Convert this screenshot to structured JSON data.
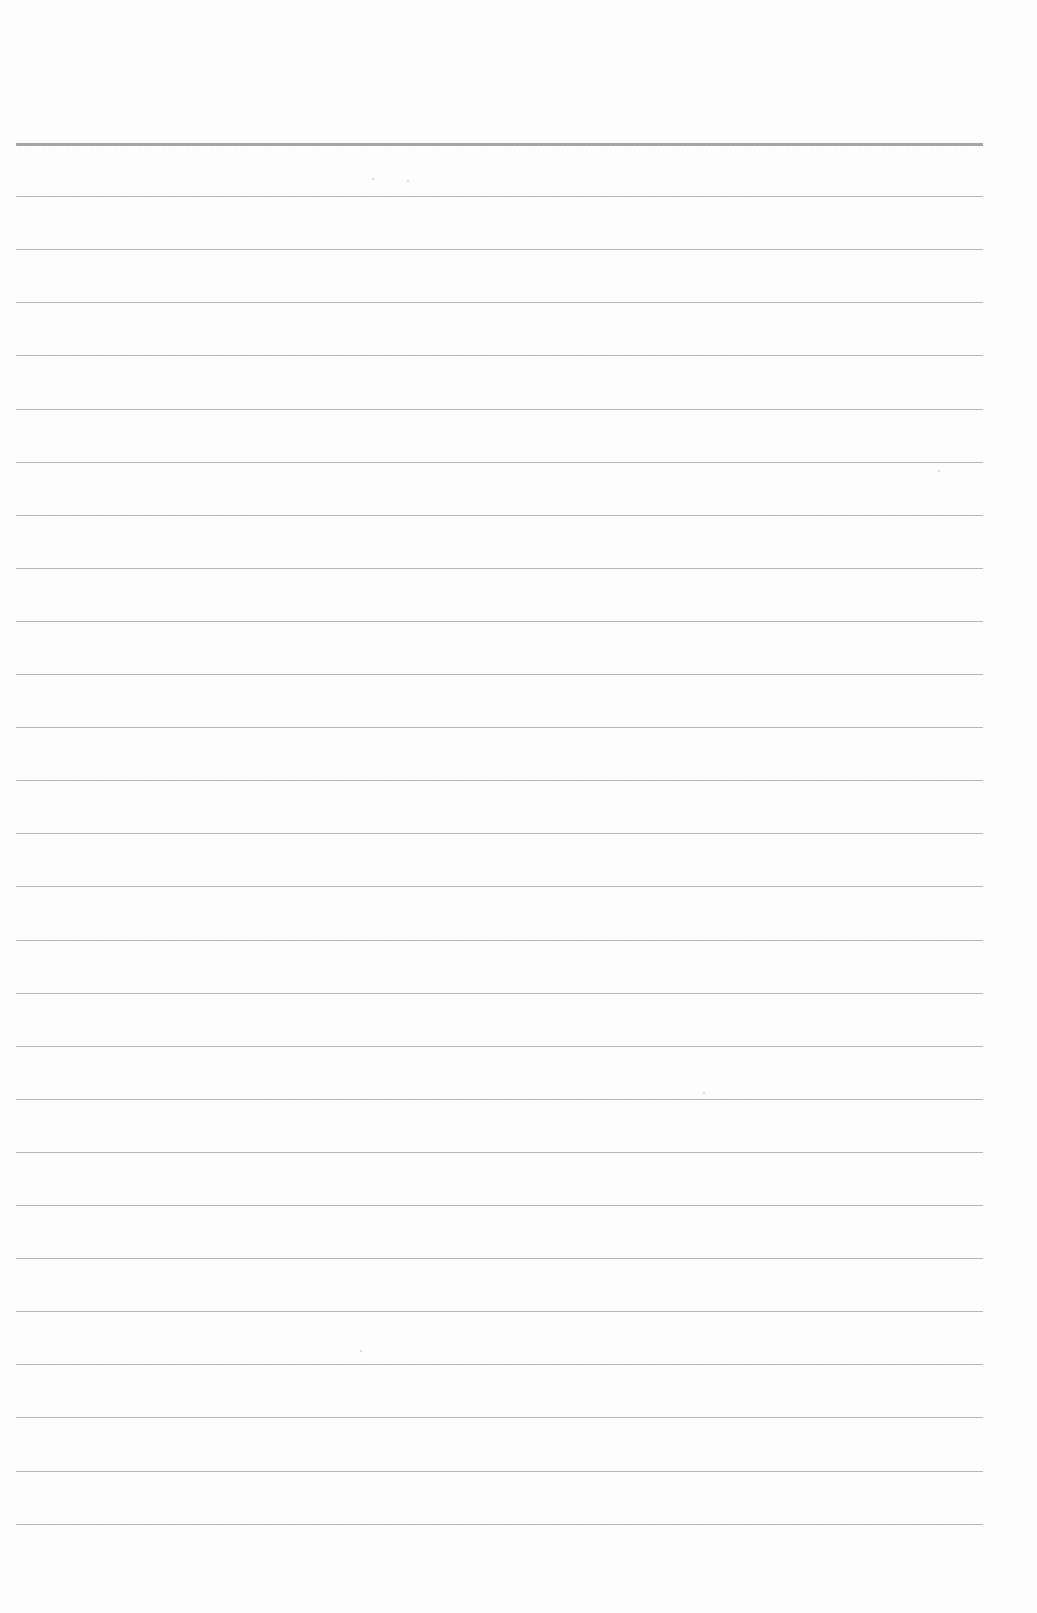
{
  "page": {
    "type": "blank ruled paper",
    "background_color": "#fdfdfd",
    "rule_color": "#b0b0b0",
    "top_rule_color": "#a0a0a0",
    "rule_left": 16,
    "rule_right": 983,
    "first_rule_y": 143,
    "rule_spacing": 53.1,
    "rule_count": 27
  }
}
